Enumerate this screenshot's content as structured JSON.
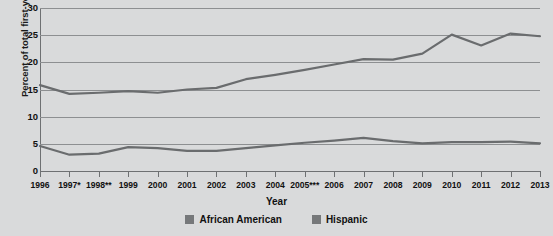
{
  "chart_data": {
    "type": "line",
    "title": "",
    "xlabel": "Year",
    "ylabel": "Percent of total first-year enrollment",
    "categories": [
      "1996",
      "1997*",
      "1998**",
      "1999",
      "2000",
      "2001",
      "2002",
      "2003",
      "2004",
      "2005***",
      "2006",
      "2007",
      "2008",
      "2009",
      "2010",
      "2011",
      "2012",
      "2013"
    ],
    "x": [
      1996,
      1997,
      1998,
      1999,
      2000,
      2001,
      2002,
      2003,
      2004,
      2005,
      2006,
      2007,
      2008,
      2009,
      2010,
      2011,
      2012,
      2013
    ],
    "ylim": [
      0,
      30
    ],
    "yticks": [
      0,
      5,
      10,
      15,
      20,
      25,
      30
    ],
    "grid": true,
    "legend_position": "bottom",
    "series": [
      {
        "name": "African American",
        "color": "#6a6c6e",
        "values": [
          4.6,
          3.0,
          3.2,
          4.4,
          4.2,
          3.7,
          3.7,
          4.2,
          4.7,
          5.2,
          5.6,
          6.1,
          5.5,
          5.1,
          5.3,
          5.3,
          5.4,
          5.1
        ]
      },
      {
        "name": "Hispanic",
        "color": "#6a6c6e",
        "values": [
          15.8,
          14.2,
          14.4,
          14.7,
          14.4,
          15.0,
          15.3,
          16.9,
          17.7,
          18.6,
          19.6,
          20.6,
          20.5,
          21.6,
          25.1,
          23.1,
          25.3,
          24.8
        ]
      }
    ]
  },
  "legend": {
    "items": [
      {
        "label": "African American"
      },
      {
        "label": "Hispanic"
      }
    ]
  }
}
